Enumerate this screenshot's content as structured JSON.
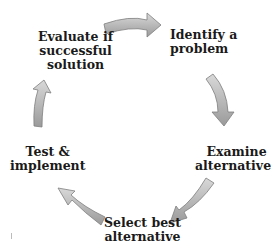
{
  "diagram": {
    "type": "cycle",
    "steps": [
      {
        "id": "identify",
        "label_line1": "Identify a",
        "label_line2": "problem"
      },
      {
        "id": "examine",
        "label_line1": "Examine",
        "label_line2": "alternatives"
      },
      {
        "id": "select",
        "label_line1": "Select best",
        "label_line2": "alternative"
      },
      {
        "id": "test",
        "label_line1": "Test &",
        "label_line2": "implement"
      },
      {
        "id": "evaluate",
        "label_line1": "Evaluate if",
        "label_line2": "successful",
        "label_line3": "solution"
      }
    ],
    "arrow_color": "#a6a6a6",
    "arrow_outline": "#7f7f7f"
  }
}
